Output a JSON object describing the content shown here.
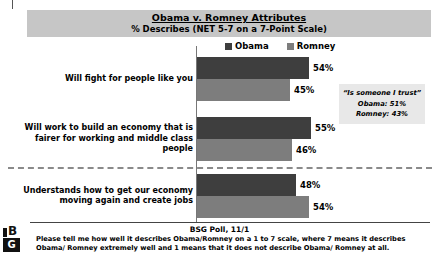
{
  "chart_data": {
    "type": "bar",
    "orientation": "horizontal",
    "title": "Obama v. Romney Attributes",
    "subtitle": "% Describes (NET 5-7 on a 7-Point Scale)",
    "legend_position": "top",
    "grid": false,
    "unit": "%",
    "categories": [
      "Will fight for people like you",
      "Will work to build an economy that is fairer for working and middle class people",
      "Understands how to get our economy moving again and create jobs"
    ],
    "series": [
      {
        "name": "Obama",
        "color": "#3e3e3e",
        "values": [
          54,
          55,
          48
        ],
        "labels": [
          "54%",
          "55%",
          "48%"
        ]
      },
      {
        "name": "Romney",
        "color": "#7d7d7d",
        "values": [
          45,
          46,
          54
        ],
        "labels": [
          "45%",
          "46%",
          "54%"
        ]
      }
    ],
    "annotation": {
      "lines": [
        "“Is someone I trust”",
        "Obama: 51%",
        "Romney: 43%"
      ]
    }
  },
  "footer": {
    "source": "BSG Poll, 11/1",
    "note": "Please tell me how well it describes Obama/Romney on a 1 to 7 scale, where 7 means it describes Obama/ Romney extremely well and 1 means that it does not describe Obama/ Romney at all.",
    "logo_letter_top": "B",
    "logo_letter_bottom": "G"
  }
}
